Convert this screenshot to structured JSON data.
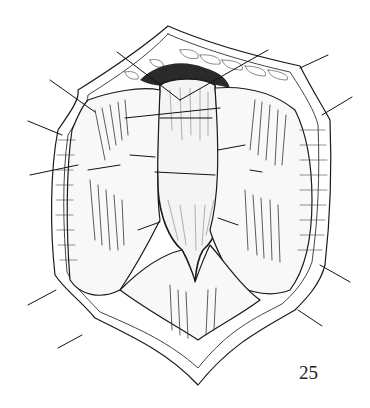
{
  "figure": {
    "number": "25"
  },
  "colors": {
    "ink": "#1a1a1a",
    "background": "#ffffff",
    "tissue_shade": "#555555"
  }
}
